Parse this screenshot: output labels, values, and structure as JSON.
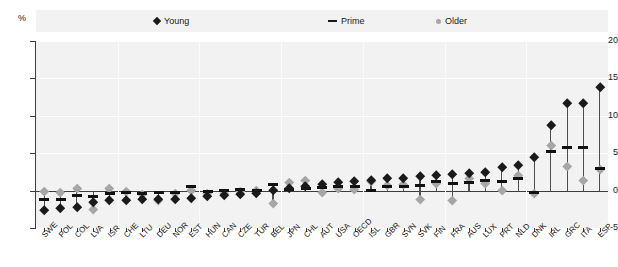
{
  "axis_unit_label": "%",
  "legend": {
    "position": "top",
    "items": [
      {
        "label": "Young",
        "marker": "diamond-icon",
        "color": "#1a1a1a"
      },
      {
        "label": "Prime",
        "marker": "dash-icon",
        "color": "#1a1a1a"
      },
      {
        "label": "Older",
        "marker": "circle-icon",
        "color": "#a6a6a6"
      }
    ]
  },
  "chart_data": {
    "type": "scatter",
    "title": "",
    "subtitle": "",
    "xlabel": "",
    "ylabel": "%",
    "ylim": [
      -5,
      20
    ],
    "yticks": [
      -5,
      0,
      5,
      10,
      15,
      20
    ],
    "ytick_labels": [
      "-5",
      "0",
      "5",
      "10",
      "15",
      "20"
    ],
    "grid": true,
    "zero_line": true,
    "categories": [
      "SWE",
      "POL",
      "COL",
      "LVA",
      "ISR",
      "CHE",
      "LTU",
      "DEU",
      "NOR",
      "EST",
      "HUN",
      "CAN",
      "CZE",
      "TUR",
      "BEL",
      "JPN",
      "CHL",
      "AUT",
      "USA",
      "OECD",
      "ISL",
      "GBR",
      "SVN",
      "SVK",
      "FIN",
      "FRA",
      "AUS",
      "LUX",
      "PRT",
      "NLD",
      "DNK",
      "IRL",
      "GRC",
      "ITA",
      "ESP"
    ],
    "series": [
      {
        "name": "Young",
        "marker": "diamond",
        "color": "#1a1a1a",
        "values": [
          -2.6,
          -2.4,
          -2.2,
          -1.5,
          -1.3,
          -1.3,
          -1.2,
          -1.2,
          -1.1,
          -1.0,
          -0.8,
          -0.6,
          -0.5,
          -0.3,
          0.0,
          0.3,
          0.6,
          0.9,
          1.1,
          1.3,
          1.4,
          1.6,
          1.7,
          1.9,
          2.0,
          2.2,
          2.3,
          2.5,
          3.1,
          3.4,
          4.4,
          8.8,
          11.7,
          11.7,
          13.8
        ]
      },
      {
        "name": "Prime",
        "marker": "dash",
        "color": "#111111",
        "values": [
          -1.2,
          -1.2,
          -0.6,
          -0.8,
          -0.4,
          -0.3,
          -0.4,
          -0.2,
          -0.2,
          0.6,
          -0.1,
          0.0,
          0.1,
          0.0,
          0.8,
          0.1,
          0.3,
          0.4,
          0.5,
          0.5,
          0.0,
          0.6,
          0.6,
          0.7,
          1.2,
          0.9,
          1.1,
          1.4,
          1.2,
          1.6,
          -0.2,
          5.2,
          5.8,
          5.8,
          3.0
        ]
      },
      {
        "name": "Older",
        "marker": "circle",
        "color": "#a6a6a6",
        "values": [
          -0.1,
          -0.2,
          0.3,
          -2.5,
          0.3,
          -0.1,
          -0.5,
          -1.3,
          -0.4,
          0.1,
          -0.3,
          -0.3,
          -0.1,
          0.0,
          -1.7,
          1.1,
          1.4,
          -0.2,
          0.3,
          0.2,
          1.3,
          0.7,
          0.8,
          -1.2,
          1.0,
          -1.3,
          1.6,
          1.0,
          0.1,
          2.0,
          -0.4,
          6.1,
          3.3,
          1.4,
          2.8
        ]
      }
    ]
  }
}
